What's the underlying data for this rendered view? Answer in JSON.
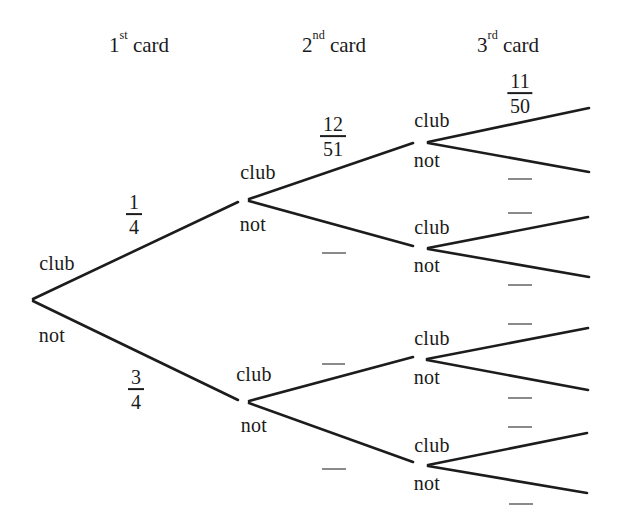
{
  "headers": [
    {
      "ordinal": "1",
      "suffix": "st",
      "word": "card"
    },
    {
      "ordinal": "2",
      "suffix": "nd",
      "word": "card"
    },
    {
      "ordinal": "3",
      "suffix": "rd",
      "word": "card"
    }
  ],
  "nodes": [
    {
      "id": "root",
      "club": "club",
      "not": "not"
    },
    {
      "id": "after-club",
      "club": "club",
      "not": "not"
    },
    {
      "id": "after-not",
      "club": "club",
      "not": "not"
    },
    {
      "id": "after-club-club",
      "club": "club",
      "not": "not"
    },
    {
      "id": "after-club-not",
      "club": "club",
      "not": "not"
    },
    {
      "id": "after-not-club",
      "club": "club",
      "not": "not"
    },
    {
      "id": "after-not-not",
      "club": "club",
      "not": "not"
    }
  ],
  "fractions": {
    "first_club": {
      "num": "1",
      "den": "4"
    },
    "first_not": {
      "num": "3",
      "den": "4"
    },
    "second_club_after_club": {
      "num": "12",
      "den": "51"
    },
    "third_club_after_club_club": {
      "num": "11",
      "den": "50"
    }
  },
  "blank_branch_probabilities": [
    "2nd-not-after-club",
    "2nd-club-after-not",
    "2nd-not-after-not",
    "3rd-not-after-club-club",
    "3rd-club-after-club-not",
    "3rd-not-after-club-not",
    "3rd-club-after-not-club",
    "3rd-not-after-not-club",
    "3rd-club-after-not-not",
    "3rd-not-after-not-not"
  ],
  "colors": {
    "line": "#1c1c1c",
    "text": "#1a1a1a",
    "blank_line": "#8a8a8a",
    "background": "#ffffff"
  }
}
